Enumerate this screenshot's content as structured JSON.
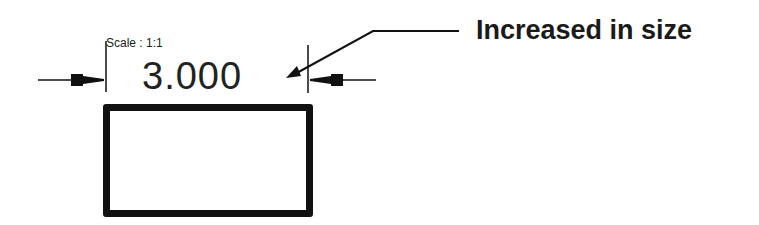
{
  "drawing": {
    "scale_label": "Scale : 1:1",
    "dimension_value": "3.000",
    "callout_text": "Increased in size",
    "colors": {
      "line": "#111111",
      "text": "#222222",
      "background": "#ffffff"
    }
  }
}
